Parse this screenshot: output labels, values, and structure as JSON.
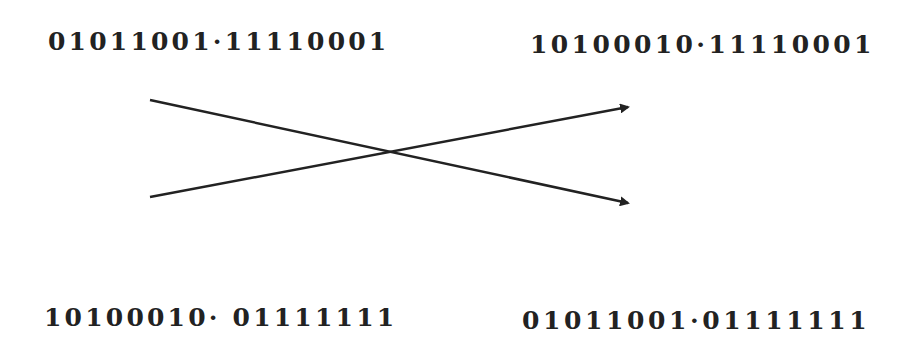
{
  "diagram": {
    "top_left": "01011001·11110001",
    "top_right": "10100010·11110001",
    "bottom_left": "10100010· 01111111",
    "bottom_right": "01011001·01111111",
    "arrows": [
      {
        "from": "top-left",
        "to": "bottom-right"
      },
      {
        "from": "bottom-left",
        "to": "top-right"
      }
    ],
    "line_color": "#222222"
  }
}
